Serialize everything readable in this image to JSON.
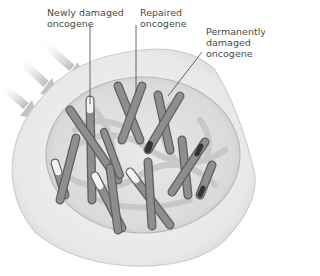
{
  "labels": {
    "newly_damaged": "Newly damaged\noncogene",
    "repaired": "Repaired\noncogene",
    "permanently_damaged": "Permanently\ndamaged\noncogene"
  },
  "colors": {
    "cell_fill": "#ebebeb",
    "cell_stroke": "#cfcfcf",
    "nucleus_fill": "#dcdcdc",
    "chromosome": "#8a8a8a",
    "chromosome_edge": "#5e5e5e",
    "chromatin": "#c4c4c4",
    "arrow": "#c8c8c8",
    "repaired_tip": "#f2f2f2",
    "damaged_band": "#333333",
    "leader_line": "#444444"
  }
}
